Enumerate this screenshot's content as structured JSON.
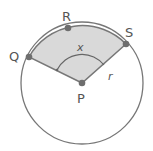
{
  "diagram": {
    "colors": {
      "outline": "#777777",
      "sector_fill": "#d9d9d9",
      "point": "#6e6e6e",
      "label": "#555555"
    },
    "circle": {
      "center_label": "P",
      "radius_label": "r"
    },
    "points": [
      {
        "id": "Q",
        "label": "Q"
      },
      {
        "id": "R",
        "label": "R"
      },
      {
        "id": "S",
        "label": "S"
      },
      {
        "id": "P",
        "label": "P"
      }
    ],
    "angle_label": "x",
    "shaded_region": "sector QPS containing R"
  }
}
